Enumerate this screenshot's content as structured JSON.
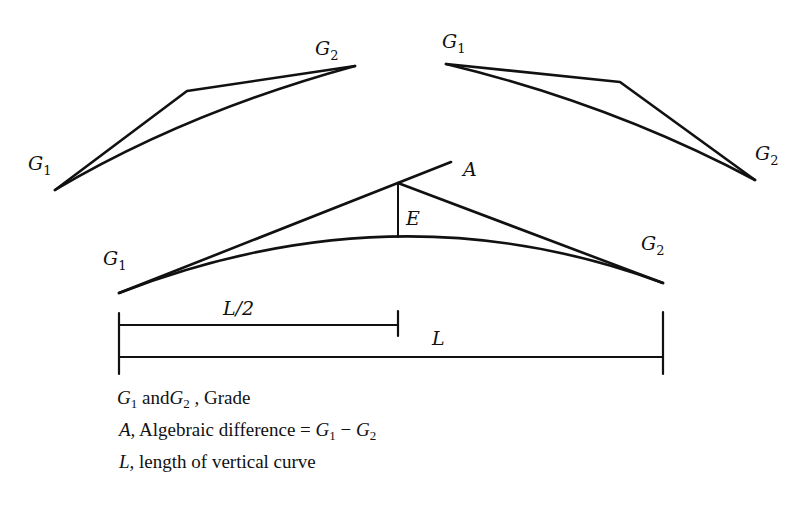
{
  "figure": {
    "diagrams": [
      {
        "name": "sag-curve-top-left",
        "labels": {
          "start": "G1",
          "end": "G2"
        },
        "points": {
          "start": [
            55,
            190
          ],
          "vertex": [
            187,
            91
          ],
          "end": [
            355,
            66
          ]
        }
      },
      {
        "name": "crest-curve-top-right",
        "labels": {
          "start": "G1",
          "end": "G2"
        },
        "points": {
          "start": [
            446,
            64
          ],
          "vertex": [
            620,
            82
          ],
          "end": [
            755,
            180
          ]
        }
      },
      {
        "name": "crest-curve-main",
        "labels": {
          "start": "G1",
          "end": "G2",
          "difference": "A",
          "external": "E"
        },
        "points": {
          "start": [
            119,
            293
          ],
          "vertex": [
            398,
            183
          ],
          "a_tip": [
            451,
            162
          ],
          "end": [
            663,
            283
          ],
          "curve_mid": [
            398,
            237
          ]
        }
      }
    ],
    "dimensions": {
      "half_length_label": "L/2",
      "length_label": "L"
    },
    "labels": {
      "g": "G",
      "sub1": "1",
      "sub2": "2",
      "a": "A",
      "e": "E",
      "half": "L/2",
      "l": "L"
    }
  },
  "legend": {
    "line1": {
      "g1": "G",
      "s1": "1",
      "and": " and",
      "g2": "G",
      "s2": "2",
      "rest": " , Grade"
    },
    "line2": {
      "a": "A,",
      "text": " Algebraic difference  = ",
      "g1": "G",
      "s1": "1",
      "minus": " − ",
      "g2": "G",
      "s2": "2"
    },
    "line3": {
      "l": "L,",
      "text": " length of vertical curve"
    }
  }
}
